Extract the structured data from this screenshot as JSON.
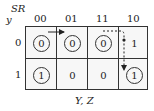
{
  "kmap": {
    "corner_top": "SR",
    "corner_left": "y",
    "columns": [
      "00",
      "01",
      "11",
      "10"
    ],
    "rows": [
      "0",
      "1"
    ],
    "cells": [
      [
        {
          "v": "0",
          "circled": true
        },
        {
          "v": "0",
          "circled": true
        },
        {
          "v": "0",
          "circled": true
        },
        {
          "v": "1",
          "circled": false
        }
      ],
      [
        {
          "v": "1",
          "circled": true
        },
        {
          "v": "0",
          "circled": false
        },
        {
          "v": "0",
          "circled": false
        },
        {
          "v": "1",
          "circled": true
        }
      ]
    ],
    "c00": "0",
    "c01": "0",
    "c02": "0",
    "c03": "1",
    "c10": "1",
    "c11": "0",
    "c12": "0",
    "c13": "1",
    "xlabel": "Y, Z"
  }
}
